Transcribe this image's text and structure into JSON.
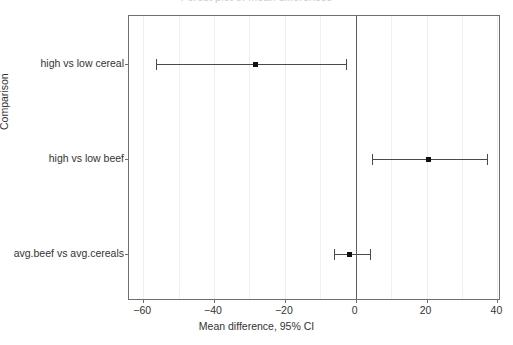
{
  "figure": {
    "clipped_top_text": "Forest plot of mean differences",
    "axis_color": "#6f6f6f",
    "point_color": "#111111",
    "line_color": "#4a4a4a",
    "grid_color": "#f0f0f2",
    "refline_color": "#5b5b5b"
  },
  "chart_data": {
    "type": "scatter",
    "subtype": "forest-plot",
    "title": "",
    "xlabel": "Mean difference, 95% CI",
    "ylabel": "Comparison",
    "xlim": [
      -64,
      41
    ],
    "xticks": [
      -60,
      -40,
      -20,
      0,
      20,
      40
    ],
    "xticklabels": [
      "−60",
      "−40",
      "−20",
      "0",
      "20",
      "40"
    ],
    "grid": true,
    "grid_minor_step": 10,
    "reference_line": 0,
    "legend": "none",
    "categories": [
      "high vs low cereal",
      "high vs low beef",
      "avg.beef vs avg.cereals"
    ],
    "estimates": [
      -28.5,
      20.4,
      -2.0
    ],
    "ci_low": [
      -56.4,
      4.6,
      -6.0
    ],
    "ci_high": [
      -2.7,
      37.0,
      4.0
    ],
    "points": [
      {
        "label": "high vs low cereal",
        "estimate": -28.5,
        "ci_low": -56.4,
        "ci_high": -2.7
      },
      {
        "label": "high vs low beef",
        "estimate": 20.4,
        "ci_low": 4.6,
        "ci_high": 37.0
      },
      {
        "label": "avg.beef vs avg.cereals",
        "estimate": -2.0,
        "ci_low": -6.0,
        "ci_high": 4.0
      }
    ]
  }
}
